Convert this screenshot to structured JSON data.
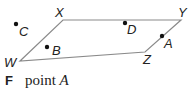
{
  "diagram": {
    "shape": "parallelogram",
    "stroke_color": "#8a8a8a",
    "point_color": "#111111",
    "vertices": [
      {
        "name": "W",
        "x": 20,
        "y": 61,
        "label_x": 4,
        "label_y": 67
      },
      {
        "name": "X",
        "x": 63,
        "y": 20,
        "label_x": 55,
        "label_y": 17
      },
      {
        "name": "Y",
        "x": 181,
        "y": 20,
        "label_x": 178,
        "label_y": 17
      },
      {
        "name": "Z",
        "x": 145,
        "y": 52,
        "label_x": 143,
        "label_y": 64
      }
    ],
    "points": [
      {
        "name": "A",
        "x": 162,
        "y": 36,
        "label_x": 164,
        "label_y": 48
      },
      {
        "name": "B",
        "x": 47,
        "y": 47,
        "label_x": 52,
        "label_y": 55
      },
      {
        "name": "C",
        "x": 16,
        "y": 24,
        "label_x": 19,
        "label_y": 36
      },
      {
        "name": "D",
        "x": 125,
        "y": 23,
        "label_x": 127,
        "label_y": 34
      }
    ]
  },
  "answer": {
    "letter": "F",
    "text": "point ",
    "variable": "A"
  }
}
